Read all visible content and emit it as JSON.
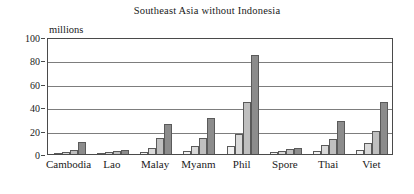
{
  "chart_data": {
    "type": "bar",
    "title": "Southeast Asia without Indonesia",
    "xlabel": "",
    "ylabel": "millions",
    "ylim": [
      0,
      100
    ],
    "yticks": [
      0,
      20,
      40,
      60,
      80,
      100
    ],
    "grid": true,
    "legend": "none",
    "categories": [
      "Cambodia",
      "Lao",
      "Malay",
      "Myanm",
      "Phil",
      "Spore",
      "Thai",
      "Viet"
    ],
    "series": [
      {
        "name": "series-1",
        "color": "#f2f2f2",
        "values": [
          0.8,
          1.0,
          1.8,
          3.0,
          6.5,
          1.5,
          2.5,
          3.5
        ]
      },
      {
        "name": "series-2",
        "color": "#d9d9d9",
        "values": [
          1.5,
          1.8,
          5.0,
          7.0,
          17.0,
          2.5,
          7.5,
          9.5
        ]
      },
      {
        "name": "series-3",
        "color": "#bfbfbf",
        "values": [
          3.2,
          2.3,
          14.0,
          14.0,
          44.5,
          4.0,
          13.0,
          20.0
        ]
      },
      {
        "name": "series-4",
        "color": "#8c8c8c",
        "values": [
          10.0,
          3.3,
          25.5,
          31.0,
          85.0,
          5.5,
          28.0,
          44.5
        ]
      }
    ]
  }
}
